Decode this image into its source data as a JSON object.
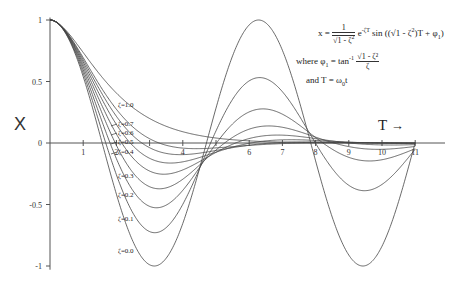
{
  "chart_data": {
    "type": "line",
    "title": "",
    "xlabel": "T",
    "ylabel": "X",
    "xlim": [
      0,
      11
    ],
    "ylim": [
      -1,
      1
    ],
    "xticks": [
      1,
      2,
      3,
      4,
      5,
      6,
      7,
      8,
      9,
      10,
      11
    ],
    "xtick_labels": [
      "1",
      "2",
      "",
      "4",
      "",
      "6",
      "7",
      "8",
      "9",
      "10",
      "11"
    ],
    "yticks": [
      1,
      0.5,
      0,
      -0.5,
      -1
    ],
    "ytick_labels": [
      "1",
      "0.5",
      "0",
      "-0.5",
      "-1"
    ],
    "grid": false,
    "legend": "inline labels",
    "series": [
      {
        "name": "ζ=1.0",
        "zeta": 1.0,
        "label_pos": [
          118,
          107
        ]
      },
      {
        "name": "ζ=0.7",
        "zeta": 0.7,
        "label_pos": [
          118,
          126
        ]
      },
      {
        "name": "ζ=0.6",
        "zeta": 0.6,
        "label_pos": [
          118,
          135
        ]
      },
      {
        "name": "ζ=0.5",
        "zeta": 0.5,
        "label_pos": [
          118,
          144
        ]
      },
      {
        "name": "ζ=0.4",
        "zeta": 0.4,
        "label_pos": [
          118,
          154
        ]
      },
      {
        "name": "ζ=0.3",
        "zeta": 0.3,
        "label_pos": [
          118,
          178
        ]
      },
      {
        "name": "ζ=0.2",
        "zeta": 0.2,
        "label_pos": [
          118,
          197
        ]
      },
      {
        "name": "ζ=0.1",
        "zeta": 0.1,
        "label_pos": [
          118,
          221
        ]
      },
      {
        "name": "ζ=0.0",
        "zeta": 0.0,
        "label_pos": [
          118,
          253
        ]
      }
    ],
    "annotations": {
      "formula": "x = 1/√(1-ζ²) e^(-ζT) sin((√(1-ζ²))T + φ1)",
      "where": "where φ1 = tan⁻¹ √(1-ζ²)/ζ",
      "and": "and T = ω0t"
    }
  },
  "labels": {
    "y_axis": "X",
    "x_axis": "T",
    "x_arrow": "→",
    "formula_lhs": "x = ",
    "formula_one": "1",
    "formula_root": "√1 - ζ",
    "formula_exp": "e",
    "formula_exp_sup": "-ζT",
    "formula_sin": " sin ((√1 - ζ",
    "formula_sin_tail": ")T + φ",
    "formula_sub1": "1",
    "formula_close": ")",
    "where_text": "where φ",
    "where_eq": " = tan",
    "where_inv": "-1",
    "where_num": "√1 - ζ²",
    "where_den": "ζ",
    "and_text": "and T = ω",
    "and_sub": "0",
    "and_tail": "t",
    "sq": "2"
  },
  "style": {
    "line_color": "#444444",
    "axis_color": "#555555"
  }
}
